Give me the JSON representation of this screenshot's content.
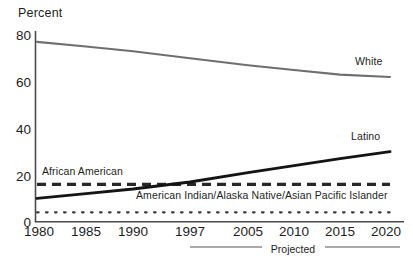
{
  "chart_data": {
    "type": "line",
    "title": "",
    "ylabel": "Percent",
    "xlabel": "",
    "ylim": [
      0,
      80
    ],
    "yticks": [
      0,
      20,
      40,
      60,
      80
    ],
    "ytick_labels": [
      "0",
      "20",
      "40",
      "60",
      "80"
    ],
    "x": [
      1980,
      1985,
      1990,
      1997,
      2005,
      2010,
      2015,
      2020
    ],
    "xtick_labels": [
      "1980",
      "1985",
      "1990",
      "1997",
      "2005",
      "2010",
      "2015",
      "2020"
    ],
    "grid": false,
    "legend": "inline-annotations",
    "series": [
      {
        "name": "White",
        "style": "solid-gray",
        "color": "#6f6f6f",
        "label": "White",
        "values": [
          77,
          75,
          73,
          70,
          67,
          65,
          63,
          62
        ]
      },
      {
        "name": "Latino",
        "style": "solid-black",
        "color": "#141414",
        "label": "Latino",
        "values": [
          10,
          12,
          14,
          17,
          21,
          24,
          27,
          30
        ]
      },
      {
        "name": "African American",
        "style": "dashed",
        "color": "#272727",
        "label": "African American",
        "values": [
          16,
          16,
          16,
          16,
          16,
          16,
          16,
          16
        ]
      },
      {
        "name": "American Indian/Alaska Native/Asian Pacific Islander",
        "style": "dotted",
        "color": "#3a3a3a",
        "label": "American Indian/Alaska Native/Asian Pacific Islander",
        "values": [
          4,
          4,
          4,
          4,
          4,
          4,
          4,
          4
        ]
      }
    ],
    "annotations": [
      {
        "text": "Projected",
        "from_year": 1997,
        "to_year": 2020,
        "position": "below-axis"
      }
    ]
  },
  "axis": {
    "y_title": "Percent"
  },
  "labels": {
    "white": "White",
    "latino": "Latino",
    "african_american": "African American",
    "aian_api": "American Indian/Alaska Native/Asian Pacific Islander",
    "projected": "Projected"
  },
  "colors": {
    "white_line": "#6f6f6f",
    "latino_line": "#141414",
    "african_american_line": "#272727",
    "aian_api_line": "#3a3a3a",
    "axis": "#4a4a4a",
    "text": "#1d1d1d"
  }
}
